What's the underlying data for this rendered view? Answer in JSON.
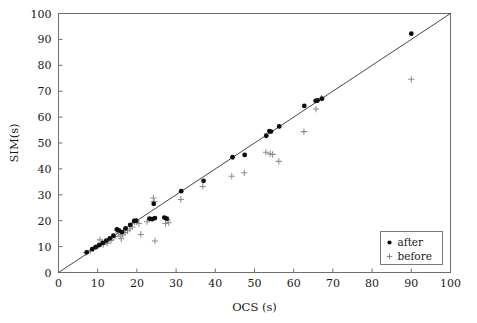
{
  "chart_data": {
    "type": "scatter",
    "title": "",
    "xlabel": "OCS (s)",
    "ylabel": "SIM(s)",
    "xlim": [
      0,
      100
    ],
    "ylim": [
      0,
      100
    ],
    "xticks": [
      0,
      10,
      20,
      30,
      40,
      50,
      60,
      70,
      80,
      90,
      100
    ],
    "yticks": [
      0,
      10,
      20,
      30,
      40,
      50,
      60,
      70,
      80,
      90,
      100
    ],
    "xtick_labels": [
      "0",
      "10",
      "20",
      "30",
      "40",
      "50",
      "60",
      "70",
      "80",
      "90",
      "100"
    ],
    "ytick_labels": [
      "0",
      "10",
      "20",
      "30",
      "40",
      "50",
      "60",
      "70",
      "80",
      "90",
      "100"
    ],
    "grid": false,
    "legend_position": "lower right",
    "reference_line": {
      "name": "identity-line",
      "equation": "y = x",
      "from": [
        0,
        0
      ],
      "to": [
        100,
        100
      ],
      "color": "#333333"
    },
    "series": [
      {
        "name": "after",
        "marker": "filled-circle",
        "color": "#0d0d0d",
        "points": [
          [
            7.2,
            7.8
          ],
          [
            8.6,
            9.0
          ],
          [
            9.5,
            9.8
          ],
          [
            10.4,
            10.6
          ],
          [
            11.3,
            11.4
          ],
          [
            12.2,
            12.3
          ],
          [
            13.1,
            13.2
          ],
          [
            14.0,
            14.2
          ],
          [
            14.9,
            16.6
          ],
          [
            15.4,
            16.3
          ],
          [
            16.2,
            15.6
          ],
          [
            17.1,
            17.0
          ],
          [
            18.3,
            18.4
          ],
          [
            19.3,
            19.9
          ],
          [
            19.8,
            20.0
          ],
          [
            23.2,
            20.8
          ],
          [
            23.9,
            20.6
          ],
          [
            24.3,
            26.5
          ],
          [
            24.6,
            21.0
          ],
          [
            27.0,
            21.2
          ],
          [
            27.6,
            20.8
          ],
          [
            31.3,
            31.4
          ],
          [
            37.0,
            35.4
          ],
          [
            44.4,
            44.5
          ],
          [
            47.5,
            45.4
          ],
          [
            53.0,
            52.8
          ],
          [
            53.8,
            54.6
          ],
          [
            54.2,
            54.4
          ],
          [
            56.3,
            56.4
          ],
          [
            62.7,
            64.3
          ],
          [
            65.6,
            66.3
          ],
          [
            66.1,
            66.4
          ],
          [
            67.2,
            67.1
          ],
          [
            90.0,
            92.2
          ]
        ]
      },
      {
        "name": "before",
        "marker": "plus",
        "color": "#8c8c8c",
        "points": [
          [
            7.0,
            7.6
          ],
          [
            8.2,
            8.5
          ],
          [
            8.9,
            9.2
          ],
          [
            9.6,
            9.9
          ],
          [
            10.2,
            10.4
          ],
          [
            10.6,
            12.6
          ],
          [
            11.0,
            11.0
          ],
          [
            11.4,
            10.8
          ],
          [
            11.9,
            11.8
          ],
          [
            12.4,
            11.3
          ],
          [
            12.9,
            12.8
          ],
          [
            13.4,
            12.4
          ],
          [
            13.9,
            13.6
          ],
          [
            14.4,
            13.9
          ],
          [
            15.0,
            16.4
          ],
          [
            15.3,
            15.3
          ],
          [
            15.7,
            14.1
          ],
          [
            16.0,
            13.0
          ],
          [
            16.4,
            14.6
          ],
          [
            17.0,
            15.4
          ],
          [
            17.6,
            16.1
          ],
          [
            18.2,
            16.8
          ],
          [
            18.8,
            17.6
          ],
          [
            19.4,
            19.4
          ],
          [
            19.9,
            19.5
          ],
          [
            20.5,
            18.9
          ],
          [
            21.0,
            14.7
          ],
          [
            22.6,
            19.6
          ],
          [
            24.2,
            28.8
          ],
          [
            24.4,
            27.4
          ],
          [
            24.6,
            12.2
          ],
          [
            27.3,
            18.9
          ],
          [
            27.9,
            20.3
          ],
          [
            28.1,
            19.2
          ],
          [
            31.2,
            28.2
          ],
          [
            36.8,
            33.2
          ],
          [
            44.2,
            37.2
          ],
          [
            47.4,
            38.5
          ],
          [
            52.9,
            46.4
          ],
          [
            54.0,
            45.8
          ],
          [
            54.6,
            45.6
          ],
          [
            56.2,
            42.9
          ],
          [
            62.6,
            54.4
          ],
          [
            65.7,
            63.1
          ],
          [
            67.1,
            67.3
          ],
          [
            90.0,
            74.6
          ]
        ]
      }
    ],
    "legend_entries": [
      {
        "label": "after",
        "marker": "filled-circle",
        "color": "#0d0d0d"
      },
      {
        "label": "before",
        "marker": "plus",
        "color": "#8c8c8c"
      }
    ]
  }
}
